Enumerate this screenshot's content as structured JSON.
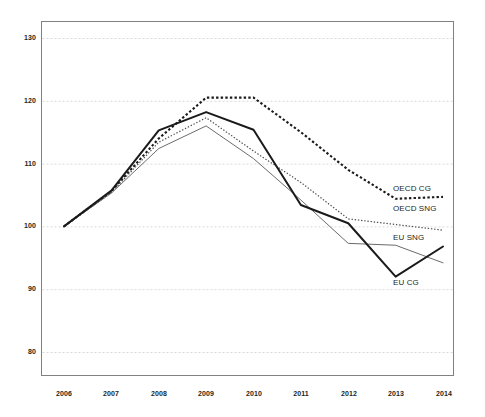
{
  "chart_data": {
    "type": "line",
    "title": "",
    "subtitle": "",
    "xlabel": "",
    "ylabel": "",
    "x": [
      2006,
      2007,
      2008,
      2009,
      2010,
      2011,
      2012,
      2013,
      2014
    ],
    "categories": [
      "2006",
      "2007",
      "2008",
      "2009",
      "2010",
      "2011",
      "2012",
      "2013",
      "2014"
    ],
    "xlim": [
      2006,
      2014
    ],
    "ylim": [
      75,
      132
    ],
    "yticks": [
      80,
      90,
      100,
      110,
      120,
      130
    ],
    "ytick_labels": [
      "80",
      "90",
      "100",
      "110",
      "120",
      "130"
    ],
    "grid": true,
    "grid_axis": "y",
    "legend": "inline-right-of-line-ends",
    "series": [
      {
        "name": "OECD CG",
        "label": "OECD CG",
        "style": "dotted-thick",
        "color": "#1a1a1a",
        "values": [
          100,
          105.6,
          114.0,
          120.5,
          120.5,
          115.0,
          109.0,
          104.4,
          104.7
        ]
      },
      {
        "name": "OECD SNG",
        "label": "OECD SNG",
        "style": "dotted-fine",
        "color": "#4d4d4d",
        "values": [
          100,
          105.4,
          113.4,
          117.3,
          112.0,
          107.0,
          101.2,
          100.3,
          99.4
        ]
      },
      {
        "name": "EU SNG",
        "label": "EU SNG",
        "style": "solid-thin",
        "color": "#6b6b6b",
        "values": [
          100,
          105.3,
          112.4,
          116.0,
          110.8,
          104.2,
          97.3,
          97.0,
          94.2
        ]
      },
      {
        "name": "EU CG",
        "label": "EU CG",
        "style": "solid-thick",
        "color": "#1a1a1a",
        "values": [
          100,
          105.7,
          115.3,
          118.2,
          115.4,
          103.4,
          100.5,
          92.0,
          96.8
        ]
      }
    ]
  },
  "axis": {
    "y_ticks": [
      "130",
      "120",
      "110",
      "100",
      "90",
      "80"
    ],
    "x_ticks": [
      "2006",
      "2007",
      "2008",
      "2009",
      "2010",
      "2011",
      "2012",
      "2013",
      "2014"
    ]
  },
  "series_labels": {
    "oecd_cg": "OECD CG",
    "oecd_sng": "OECD SNG",
    "eu_sng": "EU SNG",
    "eu_cg": "EU CG"
  },
  "colors": {
    "oecd_cg": "#1a1a1a",
    "oecd_sng": "#4d4d4d",
    "eu_sng": "#6b6b6b",
    "eu_cg": "#1a1a1a",
    "grid": "#d9d9d9",
    "border": "#808080",
    "text": "#231f20"
  }
}
